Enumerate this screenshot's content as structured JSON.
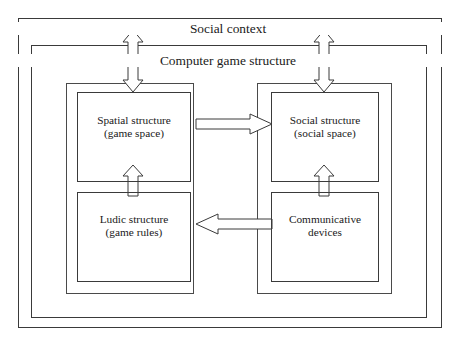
{
  "figure": {
    "title_outer": "Social context",
    "title_inner": "Computer game structure",
    "nodes": [
      {
        "id": "spatial",
        "label": "Spatial structure\n(game space)"
      },
      {
        "id": "social",
        "label": "Social structure\n(social space)"
      },
      {
        "id": "ludic",
        "label": "Ludic structure\n(game rules)"
      },
      {
        "id": "comm",
        "label": "Communicative\ndevices"
      }
    ],
    "connectors": [
      {
        "id": "spatial-to-social",
        "direction": "right",
        "style": "hollow-block"
      },
      {
        "id": "comm-to-ludic",
        "direction": "left",
        "style": "hollow-block"
      },
      {
        "id": "ludic-to-spatial",
        "direction": "up",
        "style": "hollow-block"
      },
      {
        "id": "comm-to-social",
        "direction": "up",
        "style": "hollow-block"
      },
      {
        "id": "left-context-link",
        "direction": "both",
        "style": "hollow-block"
      },
      {
        "id": "right-context-link",
        "direction": "both",
        "style": "hollow-block"
      }
    ],
    "colors": {
      "line": "#3a3a3a",
      "background": "#ffffff",
      "text": "#1a1a1a"
    }
  }
}
